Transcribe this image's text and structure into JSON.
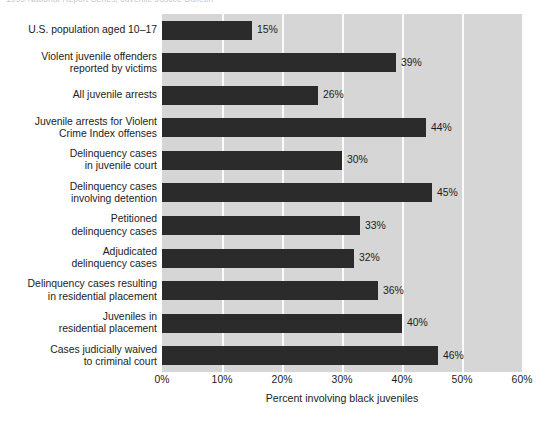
{
  "caption": {
    "text": "1999 National Report Series, Juvenile Justice Bulletin"
  },
  "chart_data": {
    "type": "bar",
    "orientation": "horizontal",
    "title": "",
    "subtitle": "",
    "xlabel": "Percent involving black juveniles",
    "ylabel": "",
    "xlim": [
      0,
      60
    ],
    "grid": true,
    "legend": null,
    "x_tick_labels": [
      "0%",
      "10%",
      "20%",
      "30%",
      "40%",
      "50%",
      "60%"
    ],
    "x_ticks": [
      0,
      10,
      20,
      30,
      40,
      50,
      60
    ],
    "categories": [
      "U.S. population aged 10–17",
      "Violent juvenile offenders\nreported by victims",
      "All juvenile arrests",
      "Juvenile arrests for Violent\nCrime Index offenses",
      "Delinquency cases\nin juvenile court",
      "Delinquency cases\ninvolving detention",
      "Petitioned\ndelinquency cases",
      "Adjudicated\ndelinquency cases",
      "Delinquency cases resulting\nin residential placement",
      "Juveniles in\nresidential placement",
      "Cases judicially waived\nto criminal court"
    ],
    "values": [
      15,
      39,
      26,
      44,
      30,
      45,
      33,
      32,
      36,
      40,
      46
    ],
    "value_labels": [
      "15%",
      "39%",
      "26%",
      "44%",
      "30%",
      "45%",
      "33%",
      "32%",
      "36%",
      "40%",
      "46%"
    ],
    "colors": {
      "bar": "#2b2b2b",
      "plot_background": "#d6d6d6",
      "gridline": "#fbfbfb",
      "figure_background": "#ffffff",
      "text": "#1c1c1c"
    }
  }
}
